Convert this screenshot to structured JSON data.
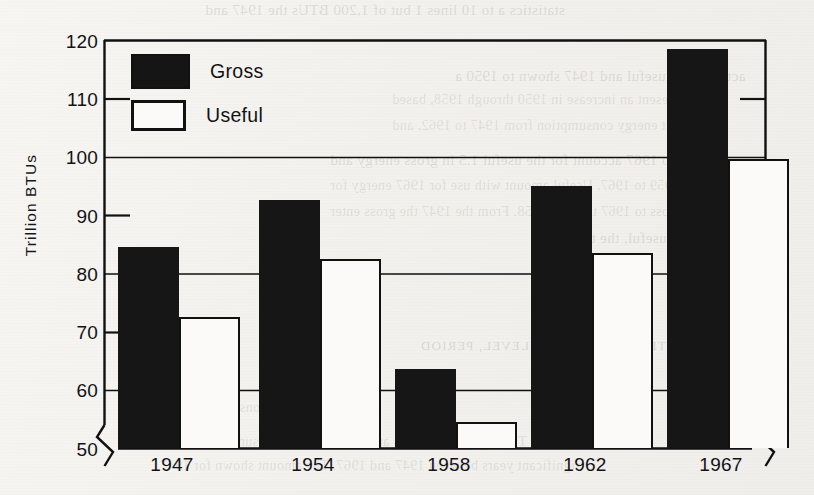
{
  "chart_data": {
    "type": "bar",
    "title": "",
    "xlabel": "",
    "ylabel": "Trillion  BTUs",
    "categories": [
      "1947",
      "1954",
      "1958",
      "1962",
      "1967"
    ],
    "series": [
      {
        "name": "Gross",
        "values": [
          84.5,
          92.5,
          63.5,
          95.0,
          118.5
        ],
        "color": "#161616"
      },
      {
        "name": "Useful",
        "values": [
          72.5,
          82.5,
          54.5,
          83.5,
          99.5
        ],
        "color": "#fbfaf8"
      }
    ],
    "ylim": [
      50,
      120
    ],
    "yticks": [
      50,
      60,
      70,
      80,
      90,
      100,
      110,
      120
    ],
    "ytick_labels": [
      "50",
      "60",
      "70",
      "80",
      "90",
      "100",
      "110",
      "120"
    ],
    "gridlines": [
      60,
      80,
      100
    ],
    "grid": true,
    "axis_break": "y-axis broken below 50 (zig-zag marks on both left and right spines)",
    "legend_position": "top-left inside plot area",
    "legend_entries": [
      "Gross",
      "Useful"
    ]
  },
  "legend": {
    "gross_label": "Gross",
    "useful_label": "Useful"
  },
  "axes": {
    "y_title": "Trillion  BTUs",
    "y_labels": [
      "120",
      "110",
      "100",
      "90",
      "80",
      "70",
      "60",
      "50"
    ],
    "x_labels": [
      "1947",
      "1954",
      "1958",
      "1962",
      "1967"
    ]
  },
  "background_text": {
    "lines": [
      "statistics a to 10 lines 1 but of 1,200 BTUs the 1947 and",
      "activities of useful and 1947 shown to 1950 a",
      "represent an increase in 1950 through 1958, based",
      "which at energy consumption from 1947 to 1962, and",
      "of 1947 to 1967 account for the useful 1.5 in gross energy and",
      "1959 to 1967. Useful amount with use for 1967 energy for",
      "the gross to 1967 through 1958. From the 1947 the gross enter",
      "was useful, the total 40%.",
      "5. LONG-TERM HISTORICAL LEVEL, PERIOD",
      "Trends in Fuel Consumption",
      "The chart shows gross and useful energy consumption in five",
      "significant years between 1947 and 1967. The amount shown for 1947"
    ]
  }
}
